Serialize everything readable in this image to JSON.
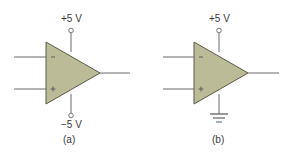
{
  "figure": {
    "colors": {
      "triangle_fill": "#bcbb98",
      "triangle_stroke": "#5a5a48",
      "wire": "#6a6a6a",
      "ground": "#555555",
      "ground_accent": "#5a6a9a",
      "text": "#3a3a3a"
    },
    "panels": [
      {
        "id": "a",
        "caption": "(a)",
        "top_supply": "+5 V",
        "bottom_supply": "−5 V",
        "inverting_sign": "−",
        "noninverting_sign": "+"
      },
      {
        "id": "b",
        "caption": "(b)",
        "top_supply": "+5 V",
        "bottom_connection": "ground",
        "inverting_sign": "−",
        "noninverting_sign": "+"
      }
    ]
  }
}
